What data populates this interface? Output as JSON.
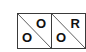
{
  "cells": [
    {
      "top_right": "O",
      "bottom_left": "O"
    },
    {
      "top_right": "R",
      "bottom_left": "O"
    }
  ],
  "colors": {
    "border": "#3a3a3a",
    "text": "#111111",
    "background": "#ffffff"
  }
}
